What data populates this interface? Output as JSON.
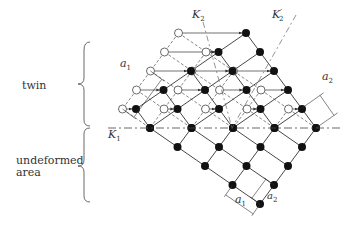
{
  "labels": {
    "twin": "twin",
    "undeformed": [
      "undeformed",
      "area"
    ],
    "K1": "K",
    "K1_sub": "1",
    "K2": "K",
    "K2_sub": "2",
    "K2p": "K",
    "K2p_sub": "2",
    "K2p_prime": "′",
    "a1": "a",
    "a1_sub": "1",
    "a2": "a",
    "a2_sub": "2"
  },
  "lattice": {
    "description": "Twinning of a 2D lattice: solid dots are atoms in final positions, open circles are original (untwinned) positions, arrows show shear displacement parallel to K1.",
    "undeformed_rows": [
      [
        0,
        0
      ],
      [
        1,
        0
      ],
      [
        2,
        0
      ],
      [
        3,
        0
      ],
      [
        4,
        0
      ]
    ],
    "colors": {
      "line": "#333333",
      "atom": "#111111",
      "open": "#ffffff"
    }
  }
}
